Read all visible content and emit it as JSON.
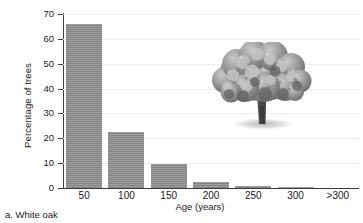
{
  "chart_data": {
    "type": "bar",
    "title": "",
    "subtitle": "",
    "xlabel": "Age (years)",
    "ylabel": "Percentage of trees",
    "categories": [
      "50",
      "100",
      "150",
      "200",
      "250",
      "300",
      ">300"
    ],
    "values": [
      66,
      22.5,
      9.5,
      2.5,
      1,
      0.3,
      0
    ],
    "ylim": [
      0,
      70
    ],
    "yticks": [
      0,
      10,
      20,
      30,
      40,
      50,
      60,
      70
    ],
    "ytick_labels": [
      "0",
      "10",
      "20",
      "30",
      "40",
      "50",
      "60",
      "70"
    ],
    "grid": true,
    "grid_axis": "y",
    "legend": false,
    "bar_color": "#8b8b8b",
    "axis_color": "#3d3d3d",
    "gridline_color": "#ececec",
    "annotations": [
      "white-oak-tree-illustration"
    ]
  },
  "figure": {
    "caption": "a. White oak",
    "illustration_name": "white-oak-tree"
  }
}
